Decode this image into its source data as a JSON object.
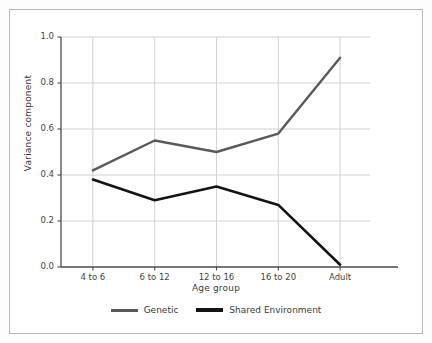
{
  "chart_data": {
    "type": "line",
    "title": "",
    "xlabel": "Age group",
    "ylabel": "Variance component",
    "categories": [
      "4 to 6",
      "6 to 12",
      "12 to 16",
      "16 to 20",
      "Adult"
    ],
    "series": [
      {
        "name": "Genetic",
        "values": [
          0.42,
          0.55,
          0.5,
          0.58,
          0.91
        ],
        "color": "#5a5a5a"
      },
      {
        "name": "Shared Environment",
        "values": [
          0.38,
          0.29,
          0.35,
          0.27,
          0.01
        ],
        "color": "#141414"
      }
    ],
    "ylim": [
      0.0,
      1.0
    ],
    "yticks": [
      "0.0",
      "0.2",
      "0.4",
      "0.6",
      "0.8",
      "1.0"
    ],
    "ytick_values": [
      0.0,
      0.2,
      0.4,
      0.6,
      0.8,
      1.0
    ],
    "grid": true,
    "grid_color": "#d2d2d2",
    "legend_position": "bottom",
    "axis_color": "#4a4a4a",
    "background": "#ffffff"
  },
  "legend": {
    "items": [
      {
        "label": "Genetic"
      },
      {
        "label": "Shared Environment"
      }
    ]
  },
  "axes": {
    "y_title": "Variance component",
    "x_title": "Age group",
    "y_ticks": [
      "1.0",
      "0.8",
      "0.6",
      "0.4",
      "0.2",
      "0.0"
    ],
    "x_ticks": [
      "4 to 6",
      "6 to 12",
      "12 to 16",
      "16 to 20",
      "Adult"
    ]
  }
}
